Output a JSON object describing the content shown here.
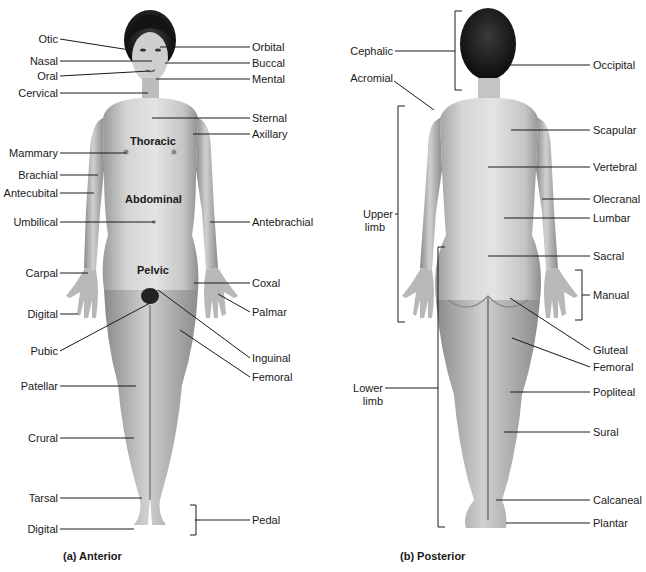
{
  "figure": {
    "anterior": {
      "caption": "(a) Anterior",
      "regions": {
        "thoracic": "Thoracic",
        "abdominal": "Abdominal",
        "pelvic": "Pelvic"
      },
      "left_labels": {
        "otic": "Otic",
        "nasal": "Nasal",
        "oral": "Oral",
        "cervical": "Cervical",
        "mammary": "Mammary",
        "brachial": "Brachial",
        "antecubital": "Antecubital",
        "umbilical": "Umbilical",
        "carpal": "Carpal",
        "digital_hand": "Digital",
        "pubic": "Pubic",
        "patellar": "Patellar",
        "crural": "Crural",
        "tarsal": "Tarsal",
        "digital_foot": "Digital"
      },
      "right_labels": {
        "orbital": "Orbital",
        "buccal": "Buccal",
        "mental": "Mental",
        "sternal": "Sternal",
        "axillary": "Axillary",
        "antebrachial": "Antebrachial",
        "coxal": "Coxal",
        "palmar": "Palmar",
        "inguinal": "Inguinal",
        "femoral": "Femoral",
        "pedal": "Pedal"
      }
    },
    "posterior": {
      "caption": "(b) Posterior",
      "left_labels": {
        "cephalic": "Cephalic",
        "acromial": "Acromial",
        "upper_limb_1": "Upper",
        "upper_limb_2": "limb",
        "lower_limb_1": "Lower",
        "lower_limb_2": "limb"
      },
      "right_labels": {
        "occipital": "Occipital",
        "scapular": "Scapular",
        "vertebral": "Vertebral",
        "olecranal": "Olecranal",
        "lumbar": "Lumbar",
        "sacral": "Sacral",
        "manual": "Manual",
        "gluteal": "Gluteal",
        "femoral": "Femoral",
        "popliteal": "Popliteal",
        "sural": "Sural",
        "calcaneal": "Calcaneal",
        "plantar": "Plantar"
      }
    }
  }
}
